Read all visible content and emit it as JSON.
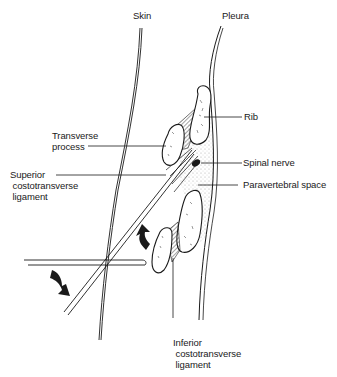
{
  "figure": {
    "labels": {
      "skin": "Skin",
      "pleura": "Pleura",
      "rib": "Rib",
      "transverse_process": "Transverse\nprocess",
      "spinal_nerve": "Spinal nerve",
      "superior_ligament": "Superior\n costotransverse\n ligament",
      "paravertebral_space": "Paravertebral space",
      "inferior_ligament": "Inferior\n costotransverse\n ligament"
    },
    "arrows": [
      {
        "name": "needle-redirect-up-arrow",
        "direction": "up"
      },
      {
        "name": "needle-redirect-down-arrow",
        "direction": "down-right"
      }
    ],
    "colors": {
      "ink": "#1a1a1a",
      "background": "#ffffff",
      "stipple": "#cfcfcf"
    }
  }
}
